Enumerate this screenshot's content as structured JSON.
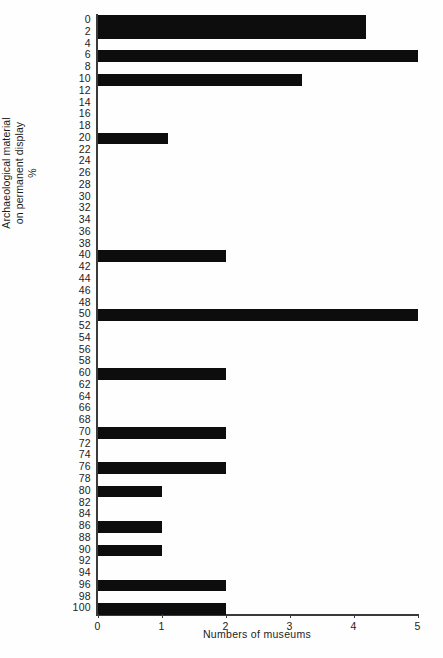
{
  "chart_data": {
    "type": "bar",
    "orientation": "horizontal",
    "title": "",
    "xlabel": "Numbers of museums",
    "ylabel": "Archaeological material on permanent display %",
    "ylabel_lines": [
      "Archaeological material",
      "on permanent display",
      "%"
    ],
    "xlim": [
      0,
      5
    ],
    "x_ticks": [
      0,
      1,
      2,
      3,
      4,
      5
    ],
    "x_tick_labels": [
      "0",
      "1",
      "2",
      "3",
      "4",
      "5"
    ],
    "grid": false,
    "legend": null,
    "bar_color": "#0d0d0d",
    "axis_color": "#3a3a3a",
    "background": "#fefefe",
    "categories": [
      "0",
      "2",
      "4",
      "6",
      "8",
      "10",
      "12",
      "14",
      "16",
      "18",
      "20",
      "22",
      "24",
      "26",
      "28",
      "30",
      "32",
      "34",
      "36",
      "38",
      "40",
      "42",
      "44",
      "46",
      "48",
      "50",
      "52",
      "54",
      "56",
      "58",
      "60",
      "62",
      "64",
      "66",
      "68",
      "70",
      "72",
      "74",
      "76",
      "78",
      "80",
      "82",
      "84",
      "86",
      "88",
      "90",
      "92",
      "94",
      "96",
      "98",
      "100"
    ],
    "values": [
      4.2,
      4.2,
      0,
      5.0,
      0,
      3.2,
      0,
      0,
      0,
      0,
      1.1,
      0,
      0,
      0,
      0,
      0,
      0,
      0,
      0,
      0,
      2.0,
      0,
      0,
      0,
      0,
      5.0,
      0,
      0,
      0,
      0,
      2.0,
      0,
      0,
      0,
      0,
      2.0,
      0,
      0,
      2.0,
      0,
      1.0,
      0,
      0,
      1.0,
      0,
      1.0,
      0,
      0,
      2.0,
      0,
      2.0
    ]
  },
  "figure": {
    "caption": ""
  }
}
